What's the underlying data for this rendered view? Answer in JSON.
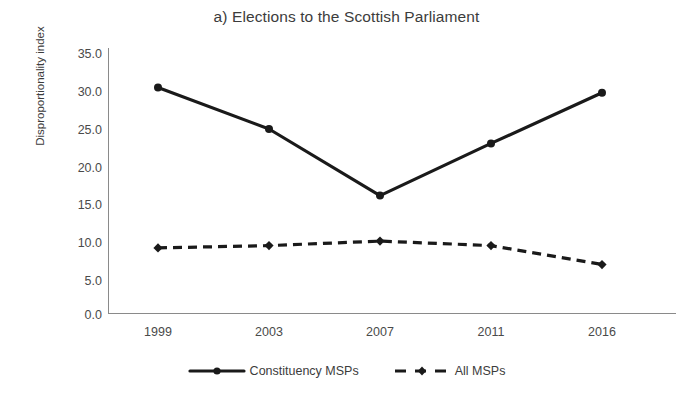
{
  "chart_data": {
    "type": "line",
    "title": "a) Elections to the Scottish Parliament",
    "xlabel": "",
    "ylabel": "Disproportionality index",
    "categories": [
      "1999",
      "2003",
      "2007",
      "2011",
      "2016"
    ],
    "x": [
      1999,
      2003,
      2007,
      2011,
      2016
    ],
    "ylim": [
      0.0,
      35.0
    ],
    "ytick_labels": [
      "35.0",
      "30.0",
      "25.0",
      "20.0",
      "15.0",
      "10.0",
      "5.0",
      "0.0"
    ],
    "ytick_values": [
      35.0,
      30.0,
      25.0,
      20.0,
      15.0,
      10.0,
      5.0,
      0.0
    ],
    "grid": false,
    "legend_position": "bottom",
    "series": [
      {
        "name": "Constituency MSPs",
        "values": [
          29.8,
          24.3,
          15.5,
          22.4,
          29.1
        ],
        "style": "solid",
        "marker": "circle",
        "color": "#1a1a1a"
      },
      {
        "name": "All MSPs",
        "values": [
          8.6,
          8.9,
          9.5,
          8.9,
          6.4
        ],
        "style": "dashed",
        "marker": "diamond",
        "color": "#1a1a1a"
      }
    ]
  },
  "legend": {
    "entries": [
      {
        "label": "Constituency MSPs",
        "marker_icon": "solid-line-circle-marker"
      },
      {
        "label": "All MSPs",
        "marker_icon": "dashed-line-diamond-marker"
      }
    ]
  },
  "colors": {
    "series_line": "#1a1a1a",
    "axis": "#8a8a8a",
    "text": "#3c3c3c",
    "background": "#ffffff"
  }
}
